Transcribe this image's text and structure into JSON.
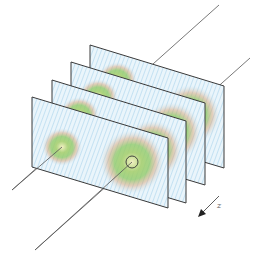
{
  "figure": {
    "axis_label": "z",
    "panel_count": 4,
    "colors": {
      "frame": "#3a3a3a",
      "axis_line": "#555555",
      "field_outer": "#7fb8e0",
      "field_mid": "#8cc860",
      "field_inner": "#e0a060",
      "background": "#ffffff"
    },
    "panels": [
      {
        "name": "panel-4-back",
        "offset": 3
      },
      {
        "name": "panel-3",
        "offset": 2
      },
      {
        "name": "panel-2",
        "offset": 1
      },
      {
        "name": "panel-1-front",
        "offset": 0
      }
    ]
  }
}
